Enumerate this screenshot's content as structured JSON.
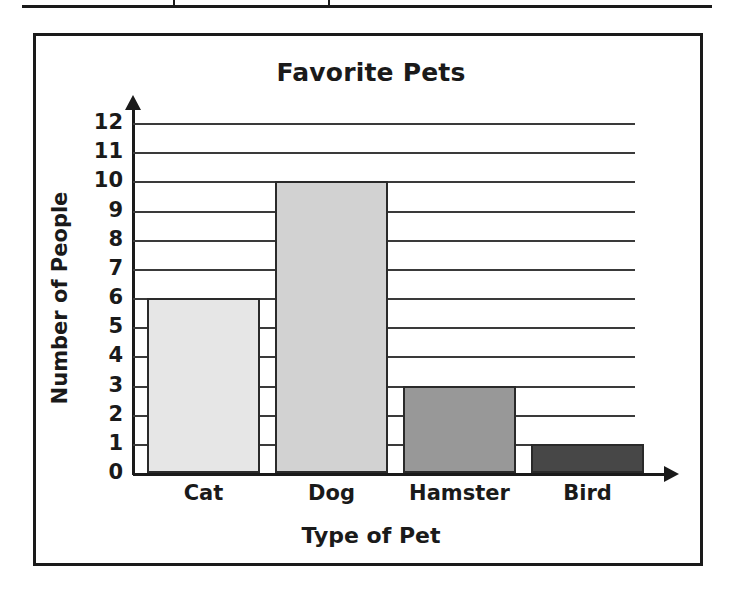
{
  "table_fragment": {
    "present": true,
    "divider_count": 2
  },
  "chart_data": {
    "type": "bar",
    "title": "Favorite Pets",
    "xlabel": "Type of Pet",
    "ylabel": "Number of People",
    "categories": [
      "Cat",
      "Dog",
      "Hamster",
      "Bird"
    ],
    "values": [
      6,
      10,
      3,
      1
    ],
    "bar_colors": [
      "#e6e6e6",
      "#d2d2d2",
      "#989898",
      "#474747"
    ],
    "ylim": [
      0,
      12
    ],
    "y_ticks": [
      12,
      11,
      10,
      9,
      8,
      7,
      6,
      5,
      4,
      3,
      2,
      1,
      0
    ],
    "grid": true,
    "legend": "none",
    "axis_color": "#1a1a1a",
    "gridline_color": "#3a3a3a",
    "background": "#ffffff"
  }
}
